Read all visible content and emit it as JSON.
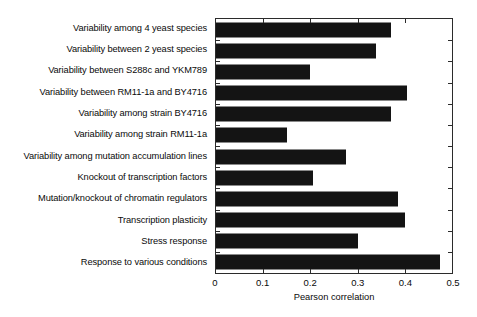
{
  "chart_data": {
    "type": "bar",
    "orientation": "horizontal",
    "title": "",
    "xlabel": "Pearson correlation",
    "ylabel": "",
    "xlim": [
      0,
      0.5
    ],
    "xticks": [
      "0",
      "0.1",
      "0.2",
      "0.3",
      "0.4",
      "0.5"
    ],
    "xtick_values": [
      0,
      0.1,
      0.2,
      0.3,
      0.4,
      0.5
    ],
    "grid": false,
    "legend": null,
    "bar_color": "#141414",
    "categories": [
      "Variability among 4 yeast species",
      "Variability between 2 yeast species",
      "Variability between S288c and YKM789",
      "Variability between RM11-1a and BY4716",
      "Variability among strain BY4716",
      "Variability among strain RM11-1a",
      "Variability among mutation accumulation lines",
      "Knockout of transcription factors",
      "Mutation/knockout of chromatin regulators",
      "Transcription plasticity",
      "Stress response",
      "Response to various conditions"
    ],
    "values": [
      0.37,
      0.34,
      0.2,
      0.405,
      0.37,
      0.15,
      0.275,
      0.205,
      0.385,
      0.4,
      0.3,
      0.475
    ]
  }
}
